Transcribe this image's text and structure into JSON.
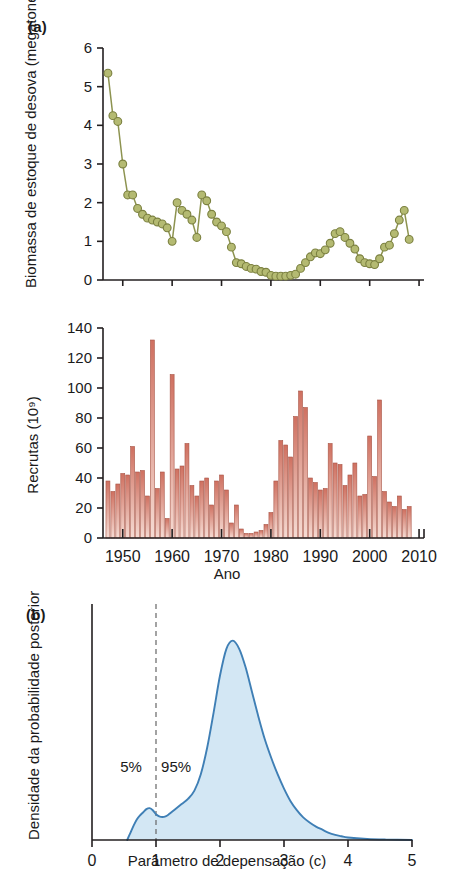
{
  "figure": {
    "panel_a_tag": "(a)",
    "panel_b_tag": "(b)"
  },
  "colors": {
    "biomass_marker_fill": "#b4ba72",
    "biomass_marker_stroke": "#7b8040",
    "biomass_line": "#8d9350",
    "recruit_bar_top": "#cf7060",
    "recruit_bar_bottom": "#f6dcd4",
    "recruit_bar_stroke": "#a85546",
    "posterior_line": "#3f7fb5",
    "posterior_fill": "#d3e7f4",
    "axis": "#231f20",
    "dashed_guide": "#666666"
  },
  "chart_data": [
    {
      "id": "biomass",
      "type": "line",
      "title": "",
      "xlabel": "",
      "ylabel": "Biomassa de estoque de desova (megatoneladas)",
      "xlim": [
        1946,
        2011
      ],
      "ylim": [
        0,
        6
      ],
      "xticks": [
        1950,
        1960,
        1970,
        1980,
        1990,
        2000,
        2010
      ],
      "xticklabels": [
        "",
        "",
        "",
        "",
        "",
        "",
        ""
      ],
      "yticks": [
        0,
        1,
        2,
        3,
        4,
        5,
        6
      ],
      "yticklabels": [
        "0",
        "1",
        "2",
        "3",
        "4",
        "5",
        "6"
      ],
      "grid": false,
      "legend": "none",
      "markers": "circle",
      "x": [
        1947,
        1948,
        1949,
        1950,
        1951,
        1952,
        1953,
        1954,
        1955,
        1956,
        1957,
        1958,
        1959,
        1960,
        1961,
        1962,
        1963,
        1964,
        1965,
        1966,
        1967,
        1968,
        1969,
        1970,
        1971,
        1972,
        1973,
        1974,
        1975,
        1976,
        1977,
        1978,
        1979,
        1980,
        1981,
        1982,
        1983,
        1984,
        1985,
        1986,
        1987,
        1988,
        1989,
        1990,
        1991,
        1992,
        1993,
        1994,
        1995,
        1996,
        1997,
        1998,
        1999,
        2000,
        2001,
        2002,
        2003,
        2004,
        2005,
        2006,
        2007,
        2008
      ],
      "y": [
        5.35,
        4.25,
        4.1,
        3.0,
        2.2,
        2.2,
        1.85,
        1.7,
        1.6,
        1.55,
        1.5,
        1.45,
        1.35,
        1.0,
        2.0,
        1.8,
        1.7,
        1.55,
        1.1,
        2.2,
        2.05,
        1.7,
        1.5,
        1.4,
        1.25,
        0.85,
        0.45,
        0.42,
        0.35,
        0.3,
        0.28,
        0.22,
        0.2,
        0.12,
        0.1,
        0.1,
        0.1,
        0.12,
        0.15,
        0.3,
        0.45,
        0.6,
        0.7,
        0.68,
        0.78,
        0.95,
        1.2,
        1.25,
        1.1,
        0.95,
        0.8,
        0.55,
        0.45,
        0.42,
        0.4,
        0.55,
        0.85,
        0.9,
        1.2,
        1.55,
        1.8,
        1.05
      ]
    },
    {
      "id": "recruits",
      "type": "bar",
      "title": "",
      "xlabel": "Ano",
      "ylabel": "Recrutas (10⁹)",
      "xlim": [
        1946,
        2011
      ],
      "ylim": [
        0,
        140
      ],
      "xticks": [
        1950,
        1960,
        1970,
        1980,
        1990,
        2000,
        2010
      ],
      "xticklabels": [
        "1950",
        "1960",
        "1970",
        "1980",
        "1990",
        "2000",
        "2010"
      ],
      "yticks": [
        0,
        20,
        40,
        60,
        80,
        100,
        120,
        140
      ],
      "yticklabels": [
        "0",
        "20",
        "40",
        "60",
        "80",
        "100",
        "120",
        "140"
      ],
      "grid": false,
      "legend": "none",
      "categories": [
        1947,
        1948,
        1949,
        1950,
        1951,
        1952,
        1953,
        1954,
        1955,
        1956,
        1957,
        1958,
        1959,
        1960,
        1961,
        1962,
        1963,
        1964,
        1965,
        1966,
        1967,
        1968,
        1969,
        1970,
        1971,
        1972,
        1973,
        1974,
        1975,
        1976,
        1977,
        1978,
        1979,
        1980,
        1981,
        1982,
        1983,
        1984,
        1985,
        1986,
        1987,
        1988,
        1989,
        1990,
        1991,
        1992,
        1993,
        1994,
        1995,
        1996,
        1997,
        1998,
        1999,
        2000,
        2001,
        2002,
        2003,
        2004,
        2005,
        2006,
        2007,
        2008
      ],
      "values": [
        38,
        31,
        36,
        43,
        42,
        61,
        44,
        45,
        28,
        132,
        33,
        44,
        13,
        109,
        46,
        48,
        63,
        35,
        28,
        38,
        40,
        22,
        38,
        42,
        32,
        10,
        22,
        6,
        3,
        3,
        4,
        5,
        9,
        17,
        38,
        65,
        62,
        54,
        81,
        98,
        87,
        40,
        37,
        32,
        33,
        63,
        50,
        49,
        35,
        42,
        50,
        28,
        29,
        68,
        41,
        92,
        31,
        24,
        21,
        28,
        19,
        21
      ]
    },
    {
      "id": "posterior",
      "type": "area",
      "title": "",
      "xlabel": "Parâmetro de depensação (c)",
      "ylabel": "Densidade da probabilidade posterior",
      "xlim": [
        0,
        5
      ],
      "ylim": [
        0,
        1.08
      ],
      "xticks": [
        0,
        1,
        2,
        3,
        4,
        5
      ],
      "xticklabels": [
        "0",
        "1",
        "2",
        "3",
        "4",
        "5"
      ],
      "yticks": [],
      "yticklabels": [],
      "grid": false,
      "legend": "none",
      "annotations": [
        {
          "text": "5%",
          "x": 0.78,
          "y": 0.33
        },
        {
          "text": "95%",
          "x": 1.08,
          "y": 0.33
        }
      ],
      "guide_line": {
        "x": 1.0,
        "style": "dashed"
      },
      "x": [
        0.55,
        0.6,
        0.65,
        0.7,
        0.75,
        0.8,
        0.85,
        0.9,
        0.95,
        1.0,
        1.05,
        1.1,
        1.15,
        1.2,
        1.3,
        1.4,
        1.5,
        1.6,
        1.7,
        1.8,
        1.9,
        2.0,
        2.1,
        2.2,
        2.3,
        2.4,
        2.5,
        2.6,
        2.7,
        2.8,
        2.9,
        3.0,
        3.1,
        3.2,
        3.3,
        3.4,
        3.5,
        3.6,
        3.7,
        3.8,
        3.9,
        4.0,
        4.3,
        4.6,
        5.0
      ],
      "y": [
        0.0,
        0.035,
        0.07,
        0.1,
        0.12,
        0.135,
        0.15,
        0.155,
        0.145,
        0.125,
        0.115,
        0.112,
        0.115,
        0.125,
        0.15,
        0.175,
        0.2,
        0.24,
        0.32,
        0.45,
        0.62,
        0.8,
        0.93,
        0.97,
        0.93,
        0.84,
        0.72,
        0.6,
        0.49,
        0.4,
        0.32,
        0.25,
        0.19,
        0.145,
        0.11,
        0.085,
        0.065,
        0.05,
        0.035,
        0.025,
        0.018,
        0.012,
        0.005,
        0.002,
        0.0
      ]
    }
  ]
}
